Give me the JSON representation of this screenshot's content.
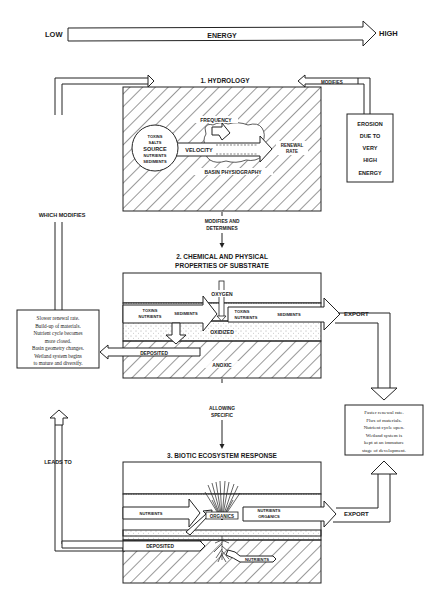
{
  "energy_scale": {
    "low_label": "LOW",
    "arrow_label": "ENERGY",
    "high_label": "HIGH"
  },
  "section1": {
    "title": "1. HYDROLOGY",
    "source": {
      "items_top": [
        "TOXINS",
        "SALTS"
      ],
      "label": "SOURCE",
      "items_bottom": [
        "NUTRIENTS",
        "SEDIMENTS"
      ]
    },
    "frequency_label": "FREQUENCY",
    "velocity_label": "VELOCITY",
    "renewal_rate_label_1": "RENEWAL",
    "renewal_rate_label_2": "RATE",
    "basin_label": "BASIN PHYSIOGRAPHY"
  },
  "connector_1_2": {
    "line1": "MODIFIES AND",
    "line2": "DETERMINES"
  },
  "section2": {
    "title_line1": "2. CHEMICAL AND PHYSICAL",
    "title_line2": "PROPERTIES OF SUBSTRATE",
    "oxygen_label": "OXYGEN",
    "inflow_line1_a": "TOXINS",
    "inflow_line2_a": "NUTRIENTS",
    "inflow_sediments": "SEDIMENTS",
    "outflow_line1_a": "TOXINS",
    "outflow_line2_a": "NUTRIENTS",
    "outflow_sediments": "SEDIMENTS",
    "oxidized_label": "OXIDIZED",
    "deposited_label": "DEPOSITED",
    "anoxic_label": "ANOXIC",
    "export_label": "EXPORT"
  },
  "connector_2_3": {
    "line1": "ALLOWING",
    "line2": "SPECIFIC"
  },
  "section3": {
    "title": "3. BIOTIC ECOSYSTEM RESPONSE",
    "nutrients_in_label": "NUTRIENTS",
    "organics_label": "ORGANICS",
    "out_line1": "NUTRIENTS",
    "out_line2": "ORGANICS",
    "deposited_label": "DEPOSITED",
    "root_nutrients_label": "NUTRIENTS",
    "export_label": "EXPORT"
  },
  "feedback": {
    "which_modifies": "WHICH MODIFIES",
    "leads_to": "LEADS TO",
    "modifies": "MODIFIES"
  },
  "erosion_box": {
    "lines": [
      "EROSION",
      "DUE TO",
      "VERY",
      "HIGH",
      "ENERGY"
    ]
  },
  "low_energy_box": {
    "lines": [
      "Slower renewal rate.",
      "Build-up of materials.",
      "Nutrient cycle becomes",
      "more closed.",
      "Basin geometry changes.",
      "Wetland system begins",
      "to mature and diversify."
    ]
  },
  "high_energy_box": {
    "lines": [
      "Faster renewal rate.",
      "Flux of materials.",
      "Nutrient cycle open.",
      "Wetland system is",
      "kept at an immature",
      "stage of development."
    ]
  }
}
